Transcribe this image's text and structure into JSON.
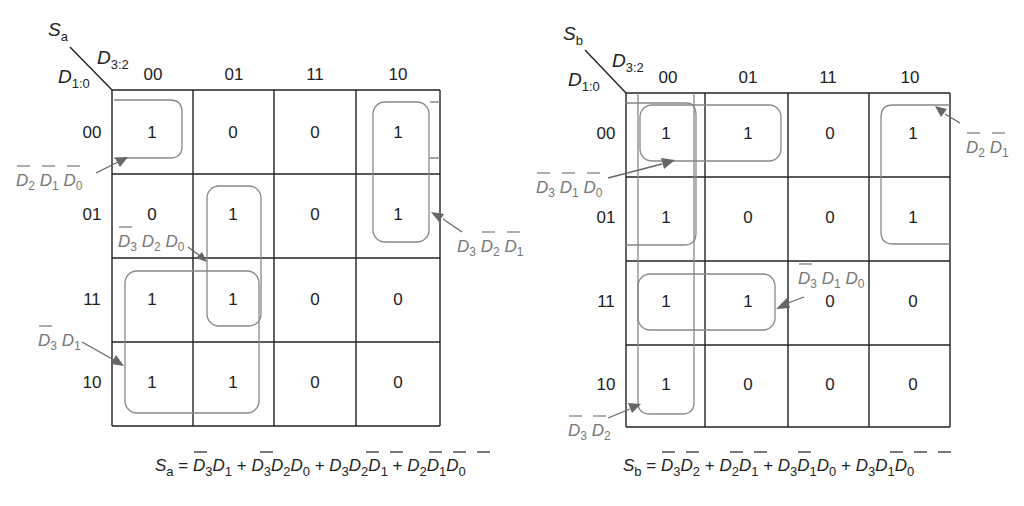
{
  "maps": [
    {
      "id": "Sa",
      "output": {
        "base": "S",
        "sub": "a"
      },
      "row_var": {
        "base": "D",
        "sub": "1:0"
      },
      "col_var": {
        "base": "D",
        "sub": "3:2"
      },
      "col_headers": [
        "00",
        "01",
        "11",
        "10"
      ],
      "row_headers": [
        "00",
        "01",
        "11",
        "10"
      ],
      "cells": [
        [
          "1",
          "0",
          "0",
          "1"
        ],
        [
          "0",
          "1",
          "0",
          "1"
        ],
        [
          "1",
          "1",
          "0",
          "0"
        ],
        [
          "1",
          "1",
          "0",
          "0"
        ]
      ],
      "groups": [
        {
          "label": "D̄2 D̄1 D̄0",
          "cells": "row 00, col 00 (wraps with col 10)"
        },
        {
          "label": "D̄3 D2 D0",
          "cells": "col 01, rows 01-11"
        },
        {
          "label": "D3 D̄2 D̄1",
          "cells": "col 10, rows 00-01"
        },
        {
          "label": "D̄3 D1",
          "cells": "cols 00-01, rows 11-10"
        }
      ],
      "labels": {
        "g1": [
          "D",
          "2",
          "D",
          "1",
          "D",
          "0"
        ],
        "g2": [
          "D",
          "3",
          "D",
          "2",
          "D",
          "0"
        ],
        "g3": [
          "D",
          "3",
          "D",
          "2",
          "D",
          "1"
        ],
        "g4": [
          "D",
          "3",
          "D",
          "1"
        ]
      },
      "equation": {
        "lhs": "S",
        "lhs_sub": "a",
        "eq": " = ",
        "terms": [
          [
            [
              "D",
              "3",
              true
            ],
            [
              "D",
              "1",
              false
            ]
          ],
          [
            [
              "D",
              "3",
              true
            ],
            [
              "D",
              "2",
              false
            ],
            [
              "D",
              "0",
              false
            ]
          ],
          [
            [
              "D",
              "3",
              false
            ],
            [
              "D",
              "2",
              true
            ],
            [
              "D",
              "1",
              true
            ]
          ],
          [
            [
              "D",
              "2",
              true
            ],
            [
              "D",
              "1",
              true
            ],
            [
              "D",
              "0",
              true
            ]
          ]
        ],
        "text": "Sa = D̄3D1 + D̄3D2D0 + D3D̄2D̄1 + D̄2D̄1D̄0"
      }
    },
    {
      "id": "Sb",
      "output": {
        "base": "S",
        "sub": "b"
      },
      "row_var": {
        "base": "D",
        "sub": "1:0"
      },
      "col_var": {
        "base": "D",
        "sub": "3:2"
      },
      "col_headers": [
        "00",
        "01",
        "11",
        "10"
      ],
      "row_headers": [
        "00",
        "01",
        "11",
        "10"
      ],
      "cells": [
        [
          "1",
          "1",
          "0",
          "1"
        ],
        [
          "1",
          "0",
          "0",
          "1"
        ],
        [
          "1",
          "1",
          "0",
          "0"
        ],
        [
          "1",
          "0",
          "0",
          "0"
        ]
      ],
      "groups": [
        {
          "label": "D̄3 D̄1 D̄0",
          "cells": "row 00, cols 00-01"
        },
        {
          "label": "D̄2 D̄1",
          "cells": "rows 00-01, cols 00 & 10 (wrap)"
        },
        {
          "label": "D̄3 D1 D0",
          "cells": "row 11, cols 00-01"
        },
        {
          "label": "D̄3 D̄2",
          "cells": "col 00, all rows"
        }
      ],
      "labels": {
        "g1": [
          "D",
          "3",
          "D",
          "1",
          "D",
          "0"
        ],
        "g2": [
          "D",
          "2",
          "D",
          "1"
        ],
        "g3": [
          "D",
          "3",
          "D",
          "1",
          "D",
          "0"
        ],
        "g4": [
          "D",
          "3",
          "D",
          "2"
        ]
      },
      "equation": {
        "lhs": "S",
        "lhs_sub": "b",
        "eq": " = ",
        "text": "Sb = D̄3D̄2 + D̄2D̄1 + D̄3D1D0 + D̄3D̄1D̄0"
      }
    }
  ],
  "symbols": {
    "plus": "+",
    "equals": "="
  }
}
